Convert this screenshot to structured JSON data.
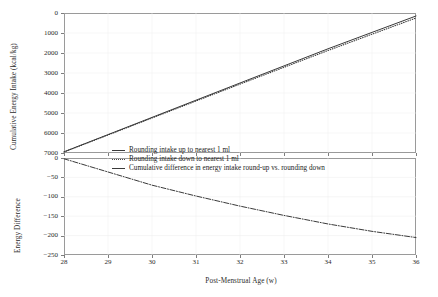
{
  "chart_data": {
    "type": "line",
    "title": "",
    "xlabel": "Post-Menstrual Age (w)",
    "xlim": [
      28,
      36
    ],
    "xticks": [
      28,
      29,
      30,
      31,
      32,
      33,
      34,
      35,
      36
    ],
    "grid": true,
    "legend_position": "center",
    "panels": [
      {
        "name": "cumulative-energy-intake",
        "ylabel": "Cumulative Energy Intake (kcal/kg)",
        "ylim": [
          0,
          7000
        ],
        "yticks": [
          0,
          1000,
          2000,
          3000,
          4000,
          5000,
          6000,
          7000
        ],
        "x": [
          28,
          29,
          30,
          31,
          32,
          33,
          34,
          35,
          36
        ],
        "series": [
          {
            "name": "Rounding intake up to nearest 1 ml",
            "style": "solid",
            "values": [
              60,
              920,
              1780,
              2640,
              3500,
              4355,
              5210,
              6030,
              6850
            ]
          },
          {
            "name": "Rounding intake down to nearest 1 ml",
            "style": "dotted",
            "values": [
              50,
              900,
              1750,
              2600,
              3445,
              4285,
              5125,
              5940,
              6750
            ]
          }
        ]
      },
      {
        "name": "energy-difference",
        "ylabel": "Energy Difference",
        "ylim": [
          -250,
          0
        ],
        "yticks": [
          0,
          -50,
          -100,
          -150,
          -200,
          -250
        ],
        "x": [
          28,
          29,
          30,
          31,
          32,
          33,
          34,
          35,
          36
        ],
        "series": [
          {
            "name": "Cumulative difference in energy intake round-up vs. rounding down",
            "style": "dashdot",
            "values": [
              -2,
              -36,
              -70,
              -98,
              -124,
              -148,
              -170,
              -189,
              -205
            ]
          }
        ]
      }
    ],
    "legend": [
      {
        "label": "Rounding intake up to nearest 1 ml",
        "style": "solid"
      },
      {
        "label": "Rounding intake down to nearest 1 ml",
        "style": "dotted"
      },
      {
        "label": "Cumulative difference in energy intake round-up vs. rounding down",
        "style": "dashdot"
      }
    ],
    "ytick_labels_top": [
      "7000",
      "6000",
      "5000",
      "4000",
      "3000",
      "2000",
      "1000",
      "0"
    ],
    "ytick_labels_bottom": [
      "0",
      "−50",
      "−100",
      "−150",
      "−200",
      "−250"
    ],
    "xtick_labels": [
      "28",
      "29",
      "30",
      "31",
      "32",
      "33",
      "34",
      "35",
      "36"
    ],
    "colors": {
      "line": "#3a3a3a",
      "grid": "#ececec",
      "frame": "#9a9a9a",
      "text": "#222222"
    }
  }
}
